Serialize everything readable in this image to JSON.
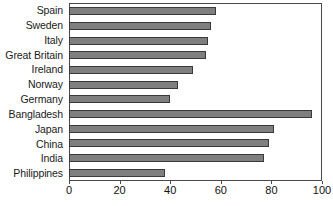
{
  "chart_data": {
    "type": "bar",
    "orientation": "horizontal",
    "title": "",
    "subtitle": "",
    "xlabel": "",
    "ylabel": "",
    "categories": [
      "Spain",
      "Sweden",
      "Italy",
      "Great Britain",
      "Ireland",
      "Norway",
      "Germany",
      "Bangladesh",
      "Japan",
      "China",
      "India",
      "Philippines"
    ],
    "values": [
      58,
      56,
      55,
      54,
      49,
      43,
      40,
      96,
      81,
      79,
      77,
      38
    ],
    "xlim": [
      0,
      100
    ],
    "xticks": [
      0,
      20,
      40,
      60,
      80,
      100
    ],
    "xtick_labels": [
      "0",
      "20",
      "40",
      "60",
      "80",
      "100"
    ],
    "grid": false,
    "legend": null,
    "bar_color": "#7f7f7f",
    "bar_border_color": "#3a3a3a",
    "axis_color": "#4a4a4a",
    "background_color": "#ffffff"
  }
}
